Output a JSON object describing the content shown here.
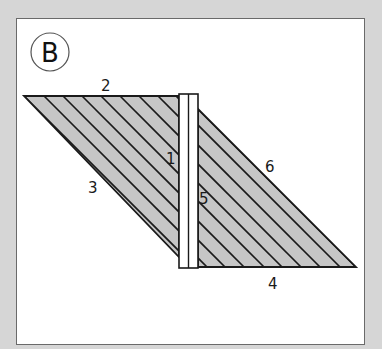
{
  "figure": {
    "panel_label": "B",
    "colors": {
      "page_background": "#d6d6d6",
      "frame_background": "#ffffff",
      "frame_border": "#6a6a6a",
      "fill": "#c6c6c6",
      "stroke": "#1a1a1a",
      "bar_fill": "#ffffff"
    },
    "labels": [
      {
        "id": "1",
        "text": "1",
        "x": 166,
        "y": 164
      },
      {
        "id": "2",
        "text": "2",
        "x": 101,
        "y": 91
      },
      {
        "id": "3",
        "text": "3",
        "x": 88,
        "y": 193
      },
      {
        "id": "4",
        "text": "4",
        "x": 268,
        "y": 289
      },
      {
        "id": "5",
        "text": "5",
        "x": 199,
        "y": 204
      },
      {
        "id": "6",
        "text": "6",
        "x": 265,
        "y": 172
      }
    ]
  }
}
